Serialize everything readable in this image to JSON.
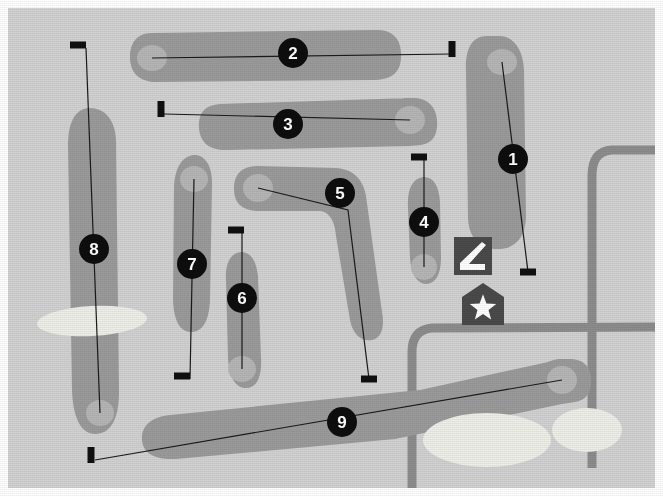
{
  "map": {
    "title": "Golf Course Layout Map",
    "width": 663,
    "height": 496,
    "frame_label": "map-frame",
    "border_color": "#ffffff",
    "background_label": "rough-background"
  },
  "colors": {
    "background_rough": "#d2d2d2",
    "fairway": "#9b9b9b",
    "green": "#b6b6b6",
    "bunker_sand": "#efefe9",
    "road_path": "#8d8d8d",
    "marker_fill": "#0d0d0d",
    "marker_text": "#ffffff",
    "tee_block": "#101010",
    "center_line": "#1a1a1a",
    "icon_box": "#4a4a4a",
    "icon_glyph": "#ffffff"
  },
  "legend_icons": [
    {
      "name": "practice-green-icon",
      "label": "Practice Putting Green",
      "glyph": "putter-club",
      "x": 454,
      "y": 237,
      "size": 38
    },
    {
      "name": "clubhouse-icon",
      "label": "Clubhouse",
      "glyph": "star-in-house",
      "x": 462,
      "y": 283,
      "size": 42
    }
  ],
  "holes": [
    {
      "number": "1",
      "marker": {
        "x": 513,
        "y": 159,
        "r": 15
      },
      "tee": {
        "x": 528,
        "y": 272,
        "w": 16,
        "h": 7
      },
      "green": {
        "cx": 502,
        "cy": 62,
        "rx": 15,
        "ry": 13
      },
      "line": [
        [
          528,
          272
        ],
        [
          502,
          62
        ]
      ],
      "fairway_path": "M 487,36 C 470,36 465,52 466,72 L 468,218 C 469,243 485,250 500,249 C 515,248 525,238 526,218 L 524,70 C 523,48 512,36 500,36 Z"
    },
    {
      "number": "2",
      "marker": {
        "x": 293,
        "y": 53,
        "r": 15
      },
      "tee": {
        "x": 452,
        "y": 49,
        "w": 7,
        "h": 16
      },
      "green": {
        "cx": 152,
        "cy": 58,
        "rx": 15,
        "ry": 13
      },
      "line": [
        [
          452,
          54
        ],
        [
          152,
          58
        ]
      ],
      "fairway_path": "M 152,33 C 136,33 130,44 130,57 C 130,72 138,81 154,82 L 375,80 C 395,79 402,70 401,52 C 400,36 390,29 374,30 Z"
    },
    {
      "number": "3",
      "marker": {
        "x": 288,
        "y": 124,
        "r": 15
      },
      "tee": {
        "x": 161,
        "y": 109,
        "w": 7,
        "h": 16
      },
      "green": {
        "cx": 410,
        "cy": 120,
        "rx": 15,
        "ry": 14
      },
      "line": [
        [
          164,
          114
        ],
        [
          410,
          120
        ]
      ],
      "fairway_path": "M 410,98 C 392,97 385,107 384,122 C 383,138 393,146 410,146 L 421,145 C 434,143 438,133 437,120 C 436,107 428,99 416,98 Z M 220,104 C 204,105 198,114 199,128 C 200,143 210,150 226,150 L 410,146 L 410,98 Z"
    },
    {
      "number": "4",
      "marker": {
        "x": 424,
        "y": 222,
        "r": 15
      },
      "tee": {
        "x": 419,
        "y": 157,
        "w": 16,
        "h": 7
      },
      "green": {
        "cx": 424,
        "cy": 267,
        "rx": 13,
        "ry": 13
      },
      "line": [
        [
          424,
          160
        ],
        [
          424,
          267
        ]
      ],
      "fairway_path": "M 424,177 C 412,178 407,190 408,208 L 410,258 C 411,275 418,284 426,284 C 435,284 441,275 441,258 L 440,202 C 439,185 433,177 424,177 Z"
    },
    {
      "number": "5",
      "marker": {
        "x": 340,
        "y": 193,
        "r": 15
      },
      "tee": {
        "x": 369,
        "y": 379,
        "w": 16,
        "h": 7
      },
      "green": {
        "cx": 258,
        "cy": 188,
        "rx": 15,
        "ry": 14
      },
      "line": [
        [
          369,
          379
        ],
        [
          348,
          210
        ],
        [
          258,
          188
        ]
      ],
      "fairway_path": "M 258,166 C 241,166 234,175 234,189 C 234,204 243,211 259,211 L 320,211 C 330,212 335,222 336,236 L 350,320 C 353,336 363,342 372,340 C 381,338 385,328 382,312 L 366,196 C 363,178 352,169 336,168 Z"
    },
    {
      "number": "6",
      "marker": {
        "x": 242,
        "y": 298,
        "r": 15
      },
      "tee": {
        "x": 236,
        "y": 230,
        "w": 16,
        "h": 7
      },
      "green": {
        "cx": 242,
        "cy": 369,
        "rx": 14,
        "ry": 13
      },
      "line": [
        [
          242,
          233
        ],
        [
          242,
          369
        ]
      ],
      "fairway_path": "M 241,252 C 230,253 225,264 226,280 L 228,358 C 229,378 236,388 246,388 C 257,388 262,377 261,358 L 258,276 C 256,259 250,252 241,252 Z"
    },
    {
      "number": "7",
      "marker": {
        "x": 192,
        "y": 264,
        "r": 15
      },
      "tee": {
        "x": 182,
        "y": 376,
        "w": 16,
        "h": 7
      },
      "green": {
        "cx": 194,
        "cy": 179,
        "rx": 14,
        "ry": 13
      },
      "line": [
        [
          190,
          379
        ],
        [
          194,
          179
        ]
      ],
      "fairway_path": "M 194,155 C 182,156 175,168 174,186 L 173,300 C 174,323 181,332 191,332 C 202,332 209,322 210,300 L 212,184 C 212,165 205,155 194,155 Z"
    },
    {
      "number": "8",
      "marker": {
        "x": 94,
        "y": 249,
        "r": 15
      },
      "tee": {
        "x": 78,
        "y": 45,
        "w": 16,
        "h": 7
      },
      "green": {
        "cx": 100,
        "cy": 413,
        "rx": 14,
        "ry": 13
      },
      "line": [
        [
          86,
          48
        ],
        [
          100,
          413
        ]
      ],
      "fairway_path": "M 88,108 C 74,110 68,124 68,145 L 72,390 C 73,420 82,434 95,434 C 110,434 119,420 119,392 L 116,140 C 115,118 103,107 88,108 Z"
    },
    {
      "number": "9",
      "marker": {
        "x": 342,
        "y": 422,
        "r": 15
      },
      "tee": {
        "x": 91,
        "y": 455,
        "w": 7,
        "h": 16
      },
      "green": {
        "cx": 562,
        "cy": 380,
        "rx": 15,
        "ry": 14
      },
      "line": [
        [
          95,
          460
        ],
        [
          562,
          380
        ]
      ],
      "fairway_path": "M 562,359 C 545,359 538,368 538,382 C 538,397 547,404 562,404 L 575,402 C 588,400 592,390 591,378 C 590,365 582,359 570,359 Z M 170,415 C 150,417 141,427 142,440 C 143,454 156,460 176,459 L 395,439 L 562,404 L 562,359 L 420,390 Z"
    }
  ],
  "bunkers": [
    {
      "name": "bunker-left-8",
      "cx": 92,
      "cy": 321,
      "rx": 55,
      "ry": 15,
      "rot": -3
    },
    {
      "name": "bunker-lower-center-9",
      "cx": 487,
      "cy": 440,
      "rx": 64,
      "ry": 27,
      "rot": 0
    },
    {
      "name": "bunker-lower-right-9",
      "cx": 587,
      "cy": 430,
      "rx": 35,
      "ry": 22,
      "rot": 0
    }
  ],
  "roads": [
    {
      "name": "road-right-edge",
      "path": "M 663,150 L 612,150 C 597,151 592,161 592,176 L 592,468"
    },
    {
      "name": "road-lower-branch",
      "path": "M 663,327 L 432,328 C 418,329 412,338 412,352 L 412,490"
    }
  ]
}
